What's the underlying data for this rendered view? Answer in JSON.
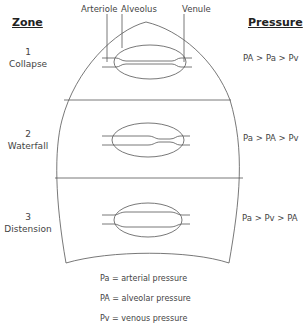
{
  "headings": {
    "zone": "Zone",
    "pressure": "Pressure"
  },
  "vessel_labels": {
    "arteriole": "Arteriole",
    "alveolus": "Alveolus",
    "venule": "Venule"
  },
  "zones": [
    {
      "number": "1",
      "name": "Collapse",
      "pressure": "PA > Pa > Pv"
    },
    {
      "number": "2",
      "name": "Waterfall",
      "pressure": "Pa > PA > Pv"
    },
    {
      "number": "3",
      "name": "Distension",
      "pressure": "Pa > Pv > PA"
    }
  ],
  "legend": [
    "Pa = arterial pressure",
    "PA = alveolar pressure",
    "Pv = venous pressure"
  ],
  "colors": {
    "line": "#555555",
    "text": "#444444"
  }
}
